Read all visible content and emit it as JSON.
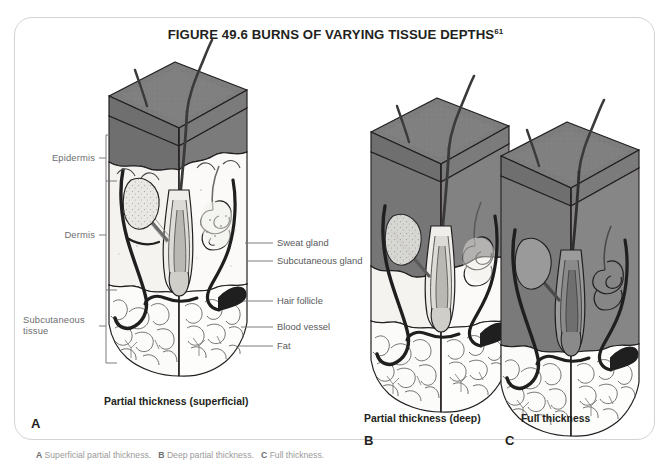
{
  "figure": {
    "title": "FIGURE 49.6 BURNS OF VARYING TISSUE DEPTHS",
    "title_superscript": "61"
  },
  "layer_labels": [
    {
      "id": "epidermis",
      "text": "Epidermis"
    },
    {
      "id": "dermis",
      "text": "Dermis"
    },
    {
      "id": "subcutaneous",
      "text": "Subcutaneous",
      "text2": "tissue"
    }
  ],
  "structure_labels": [
    {
      "id": "sweat-gland",
      "text": "Sweat gland"
    },
    {
      "id": "subcutaneous-gland",
      "text": "Subcutaneous gland"
    },
    {
      "id": "hair-follicle",
      "text": "Hair follicle"
    },
    {
      "id": "blood-vessel",
      "text": "Blood vessel"
    },
    {
      "id": "fat",
      "text": "Fat"
    }
  ],
  "panels": [
    {
      "id": "a",
      "letter": "A",
      "caption": "Partial thickness (superficial)"
    },
    {
      "id": "b",
      "letter": "B",
      "caption": "Partial thickness (deep)"
    },
    {
      "id": "c",
      "letter": "C",
      "caption": "Full thickness"
    }
  ],
  "footnote": {
    "a": "A",
    "a_text": "Superficial partial thickness.",
    "b": "B",
    "b_text": "Deep partial thickness.",
    "c": "C",
    "c_text": "Full thickness."
  },
  "colors": {
    "burn_dark": "#6b6b6b",
    "burn_mid": "#7d7d7d",
    "burn_light": "#8f8f8f",
    "tissue_light": "#f2f2f0",
    "outline": "#231f20",
    "label_gray": "#6d6e71",
    "border": "#d3d3d3"
  }
}
